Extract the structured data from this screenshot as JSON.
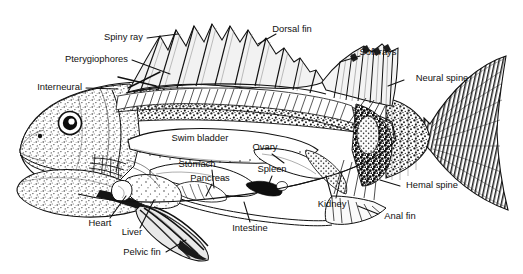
{
  "figure": {
    "background_color": "#ffffff",
    "ink_color": "#111111",
    "style": "black-and-white stippled scientific illustration with leader lines"
  },
  "labels": {
    "spiny_ray": "Spiny ray",
    "pterygiophores": "Pterygiophores",
    "interneural": "Interneural",
    "dorsal_fin": "Dorsal fin",
    "soft_rays": "Soft rays",
    "neural_spine": "Neural spine",
    "swim_bladder": "Swim bladder",
    "ovary": "Ovary",
    "stomach": "Stomach",
    "pancreas": "Pancreas",
    "spleen": "Spleen",
    "kidney": "Kidney",
    "hemal_spine": "Hemal spine",
    "anal_fin": "Anal fin",
    "intestine": "Intestine",
    "heart": "Heart",
    "liver": "Liver",
    "pelvic_fin": "Pelvic fin"
  },
  "label_list": [
    {
      "key": "spiny_ray",
      "text": "Spiny ray",
      "x": 143,
      "y": 38,
      "anchor": "end"
    },
    {
      "key": "pterygiophores",
      "text": "Pterygiophores",
      "x": 128,
      "y": 60,
      "anchor": "end"
    },
    {
      "key": "interneural",
      "text": "Interneural",
      "x": 82,
      "y": 88,
      "anchor": "end"
    },
    {
      "key": "dorsal_fin",
      "text": "Dorsal fin",
      "x": 292,
      "y": 30,
      "anchor": "middle"
    },
    {
      "key": "soft_rays",
      "text": "Soft rays",
      "x": 378,
      "y": 53,
      "anchor": "middle"
    },
    {
      "key": "neural_spine",
      "text": "Neural spine",
      "x": 442,
      "y": 79,
      "anchor": "middle"
    },
    {
      "key": "swim_bladder",
      "text": "Swim bladder",
      "x": 200,
      "y": 139,
      "anchor": "middle"
    },
    {
      "key": "ovary",
      "text": "Ovary",
      "x": 265,
      "y": 148,
      "anchor": "middle"
    },
    {
      "key": "stomach",
      "text": "Stomach",
      "x": 197,
      "y": 165,
      "anchor": "middle"
    },
    {
      "key": "pancreas",
      "text": "Pancreas",
      "x": 210,
      "y": 179,
      "anchor": "middle"
    },
    {
      "key": "spleen",
      "text": "Spleen",
      "x": 272,
      "y": 170,
      "anchor": "middle"
    },
    {
      "key": "kidney",
      "text": "Kidney",
      "x": 332,
      "y": 205,
      "anchor": "middle"
    },
    {
      "key": "hemal_spine",
      "text": "Hemal spine",
      "x": 432,
      "y": 186,
      "anchor": "middle"
    },
    {
      "key": "anal_fin",
      "text": "Anal fin",
      "x": 400,
      "y": 217,
      "anchor": "middle"
    },
    {
      "key": "intestine",
      "text": "Intestine",
      "x": 250,
      "y": 229,
      "anchor": "middle"
    },
    {
      "key": "heart",
      "text": "Heart",
      "x": 100,
      "y": 224,
      "anchor": "middle"
    },
    {
      "key": "liver",
      "text": "Liver",
      "x": 132,
      "y": 233,
      "anchor": "middle"
    },
    {
      "key": "pelvic_fin",
      "text": "Pelvic fin",
      "x": 142,
      "y": 253,
      "anchor": "middle"
    }
  ],
  "anatomy_parts": {
    "external": [
      "Dorsal fin",
      "Soft rays",
      "Spiny ray",
      "Anal fin",
      "Pelvic fin",
      "Caudal fin"
    ],
    "skeletal": [
      "Pterygiophores",
      "Interneural",
      "Neural spine",
      "Hemal spine"
    ],
    "internal_organs": [
      "Swim bladder",
      "Ovary",
      "Stomach",
      "Pancreas",
      "Spleen",
      "Kidney",
      "Intestine",
      "Heart",
      "Liver"
    ]
  }
}
